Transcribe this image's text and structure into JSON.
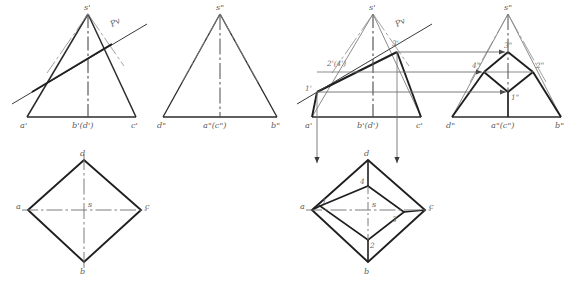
{
  "figure": {
    "domain": "engineering-drawing",
    "background_color": "#ffffff",
    "ink_color": "#2b2b2b",
    "thin_color": "#6e6e6e",
    "label_color": "#5c5c5c",
    "canvas": {
      "width": 570,
      "height": 289
    }
  },
  "views": {
    "tl": {
      "name": "front-view-before-cut",
      "labels": {
        "apex": "s'",
        "left_base": "a'",
        "mid_base": "b'(d')",
        "right_base": "c'",
        "plane_trace": "Pv"
      }
    },
    "tm": {
      "name": "side-view-before-cut",
      "labels": {
        "apex": "s\"",
        "left_base": "d\"",
        "mid_base": "a\"(c\")",
        "right_base": "b\""
      }
    },
    "tr": {
      "name": "front-view-after-cut",
      "labels": {
        "apex": "s'",
        "left_base": "a'",
        "mid_base": "b'(d')",
        "right_base": "c'",
        "plane_trace": "Pv",
        "pt1": "1'",
        "pt24": "2'(4')",
        "pt3": "3'"
      }
    },
    "trr": {
      "name": "side-view-after-cut",
      "labels": {
        "apex": "s\"",
        "left_base": "d\"",
        "mid_base": "a\"(c\")",
        "right_base": "b\"",
        "pt1": "1\"",
        "pt2": "2\"",
        "pt3": "3\"",
        "pt4": "4\""
      }
    },
    "bl": {
      "name": "top-view-before-cut",
      "labels": {
        "left": "a",
        "top": "d",
        "right": "c",
        "bottom": "b",
        "center": "s"
      }
    },
    "br": {
      "name": "top-view-after-cut",
      "labels": {
        "left": "a",
        "top": "d",
        "right": "c",
        "bottom": "b",
        "center": "s",
        "pt1": "1",
        "pt2": "2",
        "pt3": "3",
        "pt4": "4"
      }
    }
  },
  "annotations": {
    "projector_arrow_count_horizontal": 3,
    "projector_arrow_count_vertical": 2
  }
}
